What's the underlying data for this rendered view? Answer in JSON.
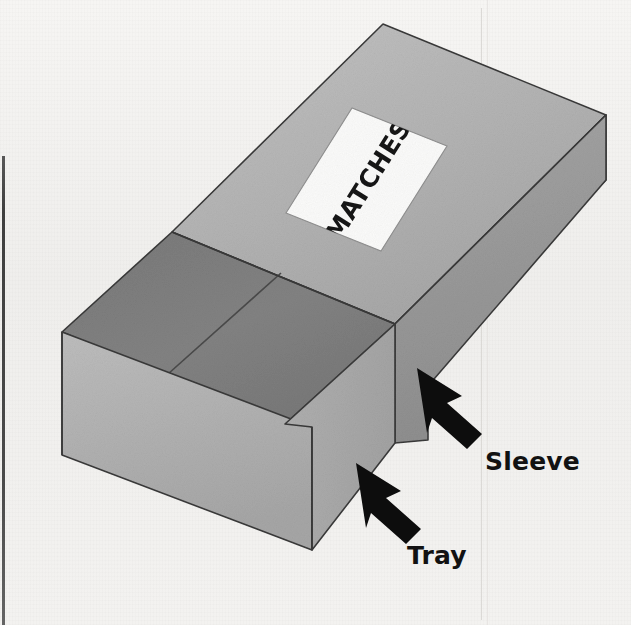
{
  "figure": {
    "kind": "line-drawing",
    "background_color": "#f2f1ef"
  },
  "box": {
    "label_text": "MATCHES",
    "label_paper_color": "#fbfbfa",
    "sleeve": {
      "name": "Sleeve",
      "top_face_color": "#b4b4b4",
      "front_face_color": "#9a9a9a",
      "end_face_color": "#8d8d8d"
    },
    "tray": {
      "name": "Tray",
      "top_face_color": "#7d7d7d",
      "inner_face_color": "#757575",
      "front_face_color": "#b2b2b2",
      "end_face_color": "#a8a8a8"
    },
    "outline_color": "#3a3a3a"
  },
  "callouts": [
    {
      "id": "sleeve",
      "label": "Sleeve",
      "arrow_direction": "up-left",
      "arrow_color": "#0d0d0d",
      "points_to": "sleeve-right-face"
    },
    {
      "id": "tray",
      "label": "Tray",
      "arrow_direction": "up-left",
      "arrow_color": "#0d0d0d",
      "points_to": "tray-front-face"
    }
  ],
  "scan_artifacts": {
    "left_edge_line_color": "#343434",
    "faint_vertical_line_color": "#d8d6d3"
  }
}
